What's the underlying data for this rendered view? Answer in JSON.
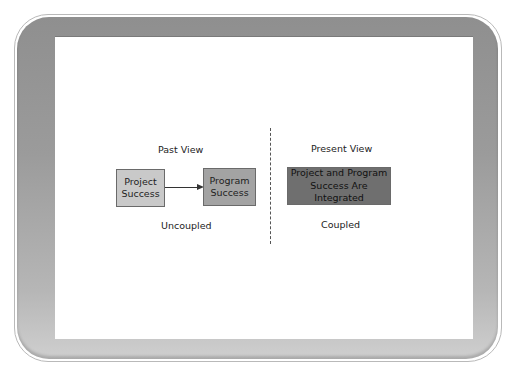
{
  "diagram": {
    "past": {
      "heading": "Past View",
      "caption": "Uncoupled",
      "box_left": {
        "text": "Project\nSuccess",
        "fill": "#c9c9c9"
      },
      "box_right": {
        "text": "Program\nSuccess",
        "fill": "#a3a3a3"
      },
      "arrow": "Project Success -> Program Success"
    },
    "present": {
      "heading": "Present View",
      "caption": "Coupled",
      "box": {
        "text": "Project and Program\nSuccess Are Integrated",
        "fill": "#6f6f6f"
      }
    }
  },
  "colors": {
    "frame": "#9a9a9a",
    "screen": "#ffffff",
    "text": "#222222"
  }
}
